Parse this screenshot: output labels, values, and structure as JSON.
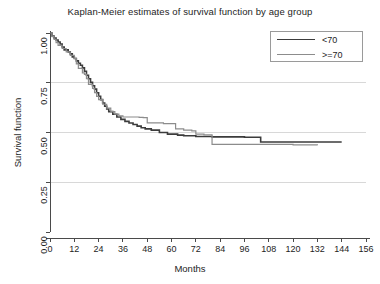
{
  "chart_data": {
    "type": "line",
    "subtype": "kaplan-meier-step",
    "title": "Kaplan-Meier estimates of survival function by age group",
    "xlabel": "Months",
    "ylabel": "Survival function",
    "xlim": [
      0,
      156
    ],
    "ylim": [
      0,
      1.0
    ],
    "xticks": [
      0,
      12,
      24,
      36,
      48,
      60,
      72,
      84,
      96,
      108,
      120,
      132,
      144,
      156
    ],
    "yticks": [
      0.0,
      0.25,
      0.5,
      0.75,
      1.0
    ],
    "ytick_labels": [
      "0.00",
      "0.25",
      "0.50",
      "0.75",
      "1.00"
    ],
    "xtick_labels": [
      "0",
      "12",
      "24",
      "36",
      "48",
      "60",
      "72",
      "84",
      "96",
      "108",
      "120",
      "132",
      "144",
      "156"
    ],
    "grid": "horizontal-only",
    "gridlines_y": [
      0.25,
      0.5,
      0.75
    ],
    "legend_position": "top-right",
    "series": [
      {
        "name": "<70",
        "color": "#3c3c3c",
        "width": 1.6,
        "points": [
          [
            0,
            1.0
          ],
          [
            1,
            0.985
          ],
          [
            2,
            0.975
          ],
          [
            3,
            0.965
          ],
          [
            4,
            0.955
          ],
          [
            5,
            0.945
          ],
          [
            6,
            0.93
          ],
          [
            7,
            0.915
          ],
          [
            9,
            0.905
          ],
          [
            10,
            0.895
          ],
          [
            11,
            0.88
          ],
          [
            12,
            0.872
          ],
          [
            13,
            0.86
          ],
          [
            14,
            0.848
          ],
          [
            15,
            0.838
          ],
          [
            16,
            0.825
          ],
          [
            17,
            0.808
          ],
          [
            18,
            0.788
          ],
          [
            19,
            0.77
          ],
          [
            20,
            0.752
          ],
          [
            21,
            0.735
          ],
          [
            22,
            0.718
          ],
          [
            23,
            0.7
          ],
          [
            24,
            0.682
          ],
          [
            25,
            0.665
          ],
          [
            26,
            0.648
          ],
          [
            27,
            0.632
          ],
          [
            28,
            0.618
          ],
          [
            29,
            0.605
          ],
          [
            31,
            0.592
          ],
          [
            33,
            0.578
          ],
          [
            35,
            0.566
          ],
          [
            37,
            0.556
          ],
          [
            39,
            0.548
          ],
          [
            41,
            0.54
          ],
          [
            43,
            0.532
          ],
          [
            45,
            0.524
          ],
          [
            47,
            0.518
          ],
          [
            50,
            0.512
          ],
          [
            54,
            0.5
          ],
          [
            58,
            0.492
          ],
          [
            63,
            0.487
          ],
          [
            66,
            0.484
          ],
          [
            72,
            0.48
          ],
          [
            80,
            0.478
          ],
          [
            96,
            0.476
          ],
          [
            104,
            0.452
          ],
          [
            144,
            0.452
          ]
        ]
      },
      {
        "name": ">=70",
        "color": "#8c8c8c",
        "width": 1.2,
        "points": [
          [
            0,
            1.0
          ],
          [
            1,
            0.982
          ],
          [
            2,
            0.968
          ],
          [
            3,
            0.952
          ],
          [
            4,
            0.938
          ],
          [
            6,
            0.922
          ],
          [
            8,
            0.905
          ],
          [
            10,
            0.888
          ],
          [
            12,
            0.872
          ],
          [
            13,
            0.845
          ],
          [
            14,
            0.822
          ],
          [
            16,
            0.8
          ],
          [
            17,
            0.792
          ],
          [
            18,
            0.77
          ],
          [
            19,
            0.742
          ],
          [
            21,
            0.722
          ],
          [
            22,
            0.7
          ],
          [
            23,
            0.682
          ],
          [
            24,
            0.665
          ],
          [
            26,
            0.642
          ],
          [
            28,
            0.622
          ],
          [
            30,
            0.605
          ],
          [
            32,
            0.592
          ],
          [
            34,
            0.584
          ],
          [
            36,
            0.578
          ],
          [
            40,
            0.578
          ],
          [
            44,
            0.576
          ],
          [
            46,
            0.575
          ],
          [
            48,
            0.548
          ],
          [
            52,
            0.548
          ],
          [
            56,
            0.545
          ],
          [
            60,
            0.545
          ],
          [
            62,
            0.518
          ],
          [
            66,
            0.512
          ],
          [
            70,
            0.508
          ],
          [
            72,
            0.492
          ],
          [
            76,
            0.488
          ],
          [
            80,
            0.44
          ],
          [
            96,
            0.44
          ],
          [
            120,
            0.438
          ],
          [
            132,
            0.436
          ]
        ]
      }
    ]
  },
  "axes_geometry": {
    "plot_left": 50,
    "plot_right": 366,
    "plot_top": 33,
    "plot_bottom": 232
  },
  "legend": {
    "entries": [
      {
        "label": "<70",
        "color": "#3c3c3c",
        "width": 1.6
      },
      {
        "label": ">=70",
        "color": "#8c8c8c",
        "width": 1.2
      }
    ]
  }
}
